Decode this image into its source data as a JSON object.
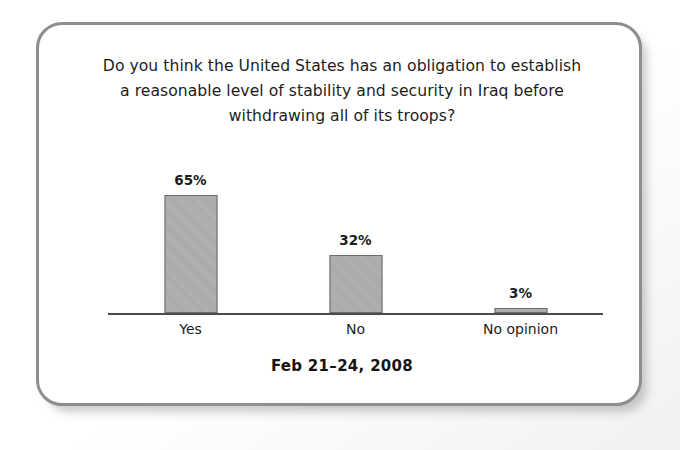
{
  "panel": {
    "border_color": "#8e8e8e",
    "background_color": "#ffffff"
  },
  "chart_data": {
    "type": "bar",
    "title": "Do you think the United States has an obligation to establish a reasonable level of stability and security in Iraq before withdrawing all of its troops?",
    "title_lines": [
      "Do you think the United States has an obligation to establish",
      "a reasonable level of stability and security in Iraq before",
      "withdrawing all of its troops?"
    ],
    "categories": [
      "Yes",
      "No",
      "No opinion"
    ],
    "values": [
      65,
      32,
      3
    ],
    "value_labels": [
      "65%",
      "32%",
      "3%"
    ],
    "xlabel": "",
    "ylabel": "",
    "ylim": [
      0,
      100
    ],
    "grid": false,
    "legend": false,
    "bar_fill_color": "#a9a9a9",
    "bar_border_color": "#6d6d6d",
    "axis_color": "#4a4a4a",
    "caption": "Feb 21–24, 2008"
  }
}
